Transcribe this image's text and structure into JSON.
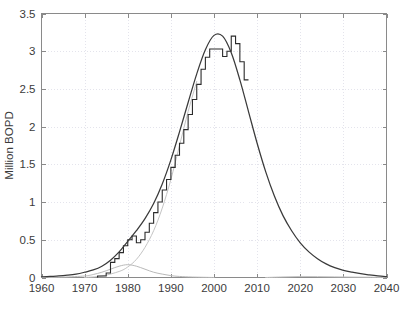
{
  "chart_data": {
    "type": "line",
    "title": "",
    "xlabel": "",
    "ylabel": "Million BOPD",
    "xlim": [
      1960,
      2040
    ],
    "ylim": [
      0,
      3.5
    ],
    "xticks": [
      1960,
      1970,
      1980,
      1990,
      2000,
      2010,
      2020,
      2030,
      2040
    ],
    "xtick_labels": [
      "1960",
      "1970",
      "1980",
      "1990",
      "2000",
      "2010",
      "2020",
      "2030",
      "2040"
    ],
    "yticks": [
      0,
      0.5,
      1,
      1.5,
      2,
      2.5,
      3,
      3.5
    ],
    "ytick_labels": [
      "0",
      "0.5",
      "1",
      "1.5",
      "2",
      "2.5",
      "3",
      "3.5"
    ],
    "grid": true,
    "grid_style": "dotted",
    "legend": "none",
    "colors": {
      "fit_curve": "#3a3a3a",
      "historical_steps": "#2b2b2b",
      "secondary_curve": "#b9b9b9",
      "tertiary_curve": "#c4c4c4",
      "axis": "#8a8a8a",
      "grid": "#d8d8e4",
      "text": "#3b3b3b",
      "background": "#ffffff"
    },
    "series": [
      {
        "name": "Total fitted production curve",
        "style": "smooth-line",
        "color": "#3a3a3a",
        "x": [
          1960,
          1962,
          1964,
          1966,
          1968,
          1970,
          1972,
          1974,
          1976,
          1978,
          1980,
          1982,
          1984,
          1986,
          1988,
          1990,
          1992,
          1994,
          1996,
          1998,
          2000,
          2002,
          2004,
          2006,
          2008,
          2010,
          2012,
          2014,
          2016,
          2018,
          2020,
          2022,
          2024,
          2026,
          2028,
          2030,
          2032,
          2034,
          2036,
          2038,
          2040
        ],
        "y": [
          0.01,
          0.015,
          0.02,
          0.03,
          0.045,
          0.07,
          0.1,
          0.15,
          0.23,
          0.34,
          0.48,
          0.62,
          0.78,
          0.98,
          1.24,
          1.56,
          1.93,
          2.32,
          2.7,
          3.02,
          3.21,
          3.2,
          2.98,
          2.62,
          2.2,
          1.78,
          1.4,
          1.08,
          0.82,
          0.62,
          0.46,
          0.34,
          0.25,
          0.18,
          0.13,
          0.095,
          0.07,
          0.05,
          0.035,
          0.022,
          0.012
        ]
      },
      {
        "name": "Reported annual production (histogram steps)",
        "style": "step",
        "color": "#2b2b2b",
        "x": [
          1973,
          1974,
          1975,
          1976,
          1977,
          1978,
          1979,
          1980,
          1981,
          1982,
          1983,
          1984,
          1985,
          1986,
          1987,
          1988,
          1989,
          1990,
          1991,
          1992,
          1993,
          1994,
          1995,
          1996,
          1997,
          1998,
          1999,
          2000,
          2001,
          2002,
          2003,
          2004,
          2005,
          2006,
          2007
        ],
        "y": [
          0.02,
          0.02,
          0.06,
          0.2,
          0.25,
          0.33,
          0.42,
          0.5,
          0.55,
          0.46,
          0.5,
          0.6,
          0.72,
          0.86,
          1.0,
          1.16,
          1.3,
          1.46,
          1.62,
          1.78,
          1.96,
          2.16,
          2.36,
          2.56,
          2.76,
          2.92,
          3.03,
          3.03,
          3.03,
          2.93,
          3.0,
          3.2,
          3.1,
          2.86,
          2.62
        ]
      },
      {
        "name": "Secondary (early) cycle curve",
        "style": "smooth-line",
        "color": "#b9b9b9",
        "x": [
          1960,
          1965,
          1970,
          1972,
          1974,
          1976,
          1978,
          1980,
          1982,
          1984,
          1986,
          1988,
          1990,
          1992,
          1995,
          2000
        ],
        "y": [
          0.0,
          0.005,
          0.02,
          0.04,
          0.07,
          0.11,
          0.15,
          0.17,
          0.15,
          0.11,
          0.07,
          0.045,
          0.025,
          0.014,
          0.006,
          0.0
        ]
      },
      {
        "name": "Tertiary (main) cycle curve",
        "style": "smooth-line",
        "color": "#c4c4c4",
        "x": [
          1970,
          1974,
          1978,
          1980,
          1982,
          1984,
          1986,
          1988,
          1990,
          1992,
          1994,
          1996
        ],
        "y": [
          0.0,
          0.02,
          0.08,
          0.14,
          0.24,
          0.4,
          0.62,
          0.92,
          1.3,
          1.75,
          2.2,
          2.6
        ]
      },
      {
        "name": "Baseline residual curve",
        "style": "smooth-line",
        "color": "#c4c4c4",
        "x": [
          2012,
          2016,
          2020,
          2024,
          2028,
          2032,
          2036,
          2040
        ],
        "y": [
          0.0,
          0.008,
          0.014,
          0.012,
          0.009,
          0.006,
          0.004,
          0.002
        ]
      }
    ]
  }
}
